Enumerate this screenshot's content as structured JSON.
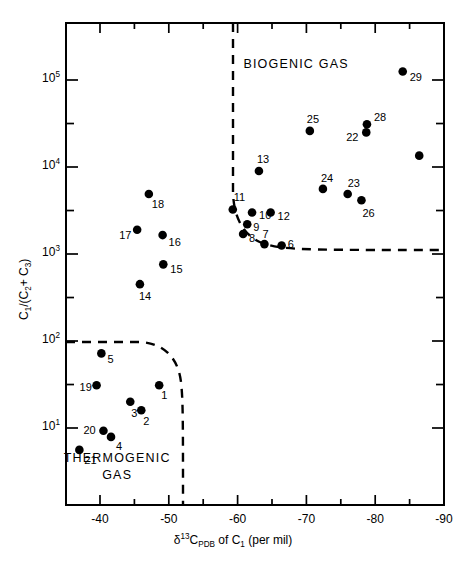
{
  "figure": {
    "type": "scatter",
    "background": "#ffffff",
    "ink_color": "#000000"
  },
  "chart_data": {
    "type": "scatter",
    "title": "",
    "xlabel": "δ 13 C PDB of C1 (per mil)",
    "ylabel": "C1 /(C2 + C3)",
    "xlabel_parts": {
      "delta": "δ",
      "sup13": "13",
      "c": "C",
      "subpdb": "PDB",
      "of": "of",
      "c1": "C",
      "sub1": "1",
      "units": "(per mil)"
    },
    "ylabel_parts": {
      "c": "C",
      "sub1": "1",
      "slash": "/(C",
      "sub2": "2",
      "plus": "+ C",
      "sub3": "3",
      "close": ")"
    },
    "xscale": "linear",
    "yscale": "log",
    "xlim": [
      -40,
      -90
    ],
    "ylim": [
      6.3,
      316000
    ],
    "x_reversed": true,
    "grid": false,
    "legend": false,
    "xticks_major": [
      -40,
      -50,
      -60,
      -70,
      -80,
      -90
    ],
    "xtick_labels": [
      "-40",
      "-50",
      "-60",
      "-70",
      "-80",
      "-90"
    ],
    "xticks_minor": [
      -45,
      -55,
      -65,
      -75,
      -85
    ],
    "yticks_major": [
      100000,
      10000,
      1000,
      100,
      10
    ],
    "ytick_labels": [
      "10⁵",
      "10⁴",
      "10³",
      "10²",
      "10¹"
    ],
    "ytick_mantissa": "10",
    "ytick_exponents": [
      "5",
      "4",
      "3",
      "2",
      "1"
    ],
    "yticks_minor": [
      31600,
      3160,
      316,
      31.6
    ],
    "regions": [
      {
        "name": "biogenic",
        "label": "BIOGENIC  GAS",
        "label_x": -68.5,
        "label_y": 150000
      },
      {
        "name": "thermogenic",
        "label_line1": "THERMOGENIC",
        "label_line2": "GAS",
        "label_x": -42.5,
        "label_y": 4.6
      }
    ],
    "points": [
      {
        "id": "1",
        "x": -48.6,
        "y": 31.0
      },
      {
        "id": "2",
        "x": -46.0,
        "y": 16.0
      },
      {
        "id": "3",
        "x": -44.4,
        "y": 20.0
      },
      {
        "id": "4",
        "x": -41.6,
        "y": 7.9
      },
      {
        "id": "5",
        "x": -40.2,
        "y": 72.0
      },
      {
        "id": "6",
        "x": -66.4,
        "y": 1250.0
      },
      {
        "id": "7",
        "x": -63.9,
        "y": 1300.0
      },
      {
        "id": "8",
        "x": -60.8,
        "y": 1700.0
      },
      {
        "id": "9",
        "x": -61.4,
        "y": 2200.0
      },
      {
        "id": "10",
        "x": -62.1,
        "y": 3000.0
      },
      {
        "id": "11",
        "x": -59.3,
        "y": 3250.0
      },
      {
        "id": "12",
        "x": -64.8,
        "y": 3000.0
      },
      {
        "id": "13",
        "x": -63.1,
        "y": 9000.0
      },
      {
        "id": "14",
        "x": -45.8,
        "y": 450.0
      },
      {
        "id": "15",
        "x": -49.2,
        "y": 760.0
      },
      {
        "id": "16",
        "x": -49.1,
        "y": 1650.0
      },
      {
        "id": "17",
        "x": -45.4,
        "y": 1900.0
      },
      {
        "id": "18",
        "x": -47.1,
        "y": 4900.0
      },
      {
        "id": "19",
        "x": -39.5,
        "y": 31.0
      },
      {
        "id": "20",
        "x": -40.5,
        "y": 9.3
      },
      {
        "id": "21",
        "x": -37.0,
        "y": 5.6
      },
      {
        "id": "22",
        "x": -78.7,
        "y": 25000.0
      },
      {
        "id": "23",
        "x": -76.0,
        "y": 4900.0
      },
      {
        "id": "24",
        "x": -72.4,
        "y": 5600.0
      },
      {
        "id": "25",
        "x": -70.5,
        "y": 26000.0
      },
      {
        "id": "26",
        "x": -78.0,
        "y": 4150.0
      },
      {
        "id": "28",
        "x": -78.8,
        "y": 31000.0
      },
      {
        "id": "29",
        "x": -84.0,
        "y": 125000.0
      },
      {
        "id": "",
        "x": -86.4,
        "y": 13500.0
      }
    ],
    "point_label_offsets": {
      "1": {
        "dx": 2,
        "dy": 11
      },
      "2": {
        "dx": 2,
        "dy": 12
      },
      "3": {
        "dx": 1,
        "dy": 12
      },
      "4": {
        "dx": 5,
        "dy": 10
      },
      "5": {
        "dx": 6,
        "dy": 7
      },
      "6": {
        "dx": 6,
        "dy": -1
      },
      "7": {
        "dx": -2,
        "dy": -9
      },
      "8": {
        "dx": 6,
        "dy": 5
      },
      "9": {
        "dx": 6,
        "dy": 4
      },
      "10": {
        "dx": 7,
        "dy": 4
      },
      "11": {
        "dx": 1,
        "dy": -11
      },
      "12": {
        "dx": 7,
        "dy": 5
      },
      "13": {
        "dx": -2,
        "dy": -11
      },
      "14": {
        "dx": -1,
        "dy": 13
      },
      "15": {
        "dx": 7,
        "dy": 6
      },
      "16": {
        "dx": 6,
        "dy": 8
      },
      "17": {
        "dx": -18,
        "dy": 6
      },
      "18": {
        "dx": 3,
        "dy": 11
      },
      "19": {
        "dx": -17,
        "dy": 3
      },
      "20": {
        "dx": -20,
        "dy": 0
      },
      "21": {
        "dx": 5,
        "dy": 11
      },
      "22": {
        "dx": -20,
        "dy": 6
      },
      "23": {
        "dx": 0,
        "dy": -10
      },
      "24": {
        "dx": -2,
        "dy": -10
      },
      "25": {
        "dx": -3,
        "dy": -11
      },
      "26": {
        "dx": 1,
        "dy": 14
      },
      "28": {
        "dx": 7,
        "dy": -6
      },
      "29": {
        "dx": 7,
        "dy": 6
      }
    },
    "boundaries": [
      {
        "name": "biogenic-boundary",
        "style": "dashed",
        "description": "vertical dashed line descending from top axis then curving right to a horizontal dashed line"
      },
      {
        "name": "thermogenic-boundary",
        "style": "dashed",
        "description": "horizontal dashed line from left axis curving down to a vertical dashed line meeting bottom axis"
      }
    ]
  }
}
